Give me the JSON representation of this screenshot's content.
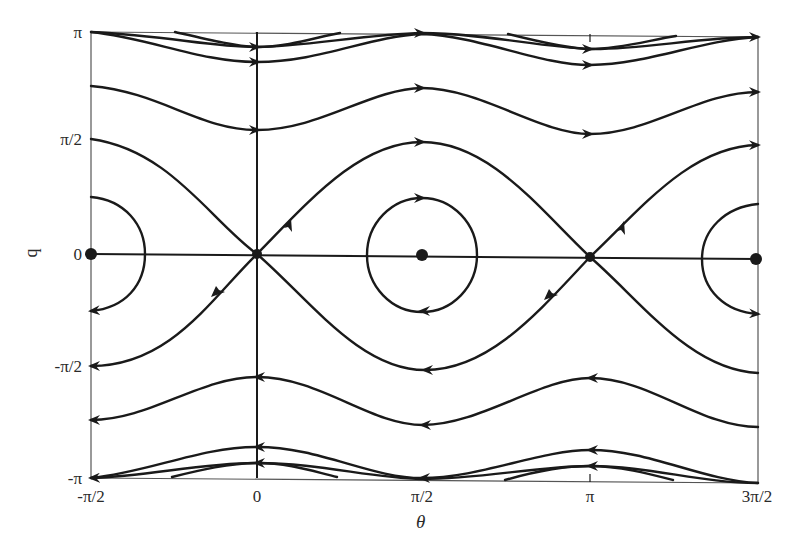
{
  "figure": {
    "xlabel": "θ",
    "ylabel": "q",
    "colors": {
      "curve": "#1a1a1a",
      "frame": "#555555",
      "background": "#ffffff"
    }
  },
  "axes": {
    "xticks": [
      {
        "label": "-π/2",
        "value": -1.5708
      },
      {
        "label": "0",
        "value": 0
      },
      {
        "label": "π/2",
        "value": 1.5708
      },
      {
        "label": "π",
        "value": 3.1416
      },
      {
        "label": "3π/2",
        "value": 4.7124
      }
    ],
    "yticks": [
      {
        "label": "π",
        "value": 3.1416
      },
      {
        "label": "π/2",
        "value": 1.5708
      },
      {
        "label": "0",
        "value": 0
      },
      {
        "label": "-π/2",
        "value": -1.5708
      },
      {
        "label": "-π",
        "value": -3.1416
      }
    ],
    "xlim": [
      "-π/2",
      "3π/2"
    ],
    "ylim": [
      "-π",
      "π"
    ]
  },
  "equilibria": {
    "centers": [
      {
        "theta": "-π/2",
        "q": "0"
      },
      {
        "theta": "π/2",
        "q": "0"
      },
      {
        "theta": "3π/2",
        "q": "0"
      }
    ],
    "saddles": [
      {
        "theta": "0",
        "q": "0"
      },
      {
        "theta": "π",
        "q": "0"
      }
    ]
  },
  "trajectories": {
    "upper_direction": "left-to-right (θ increasing)",
    "lower_direction": "right-to-left (θ decreasing)",
    "closed_orbits_direction": "clockwise around centers",
    "count_upper_open": 4,
    "count_lower_open": 4,
    "separatrices": 2
  }
}
